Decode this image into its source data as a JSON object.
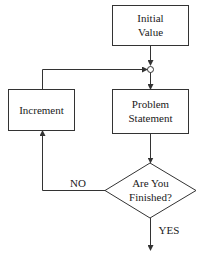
{
  "diagram": {
    "type": "flowchart",
    "nodes": [
      {
        "id": "initial",
        "shape": "rectangle",
        "line1": "Initial",
        "line2": "Value"
      },
      {
        "id": "problem",
        "shape": "rectangle",
        "line1": "Problem",
        "line2": "Statement"
      },
      {
        "id": "finished",
        "shape": "diamond",
        "line1": "Are You",
        "line2": "Finished?"
      },
      {
        "id": "increment",
        "shape": "rectangle",
        "label": "Increment"
      },
      {
        "id": "junction",
        "shape": "circle",
        "label": ""
      }
    ],
    "edges": [
      {
        "from": "initial",
        "to": "junction",
        "label": ""
      },
      {
        "from": "junction",
        "to": "problem",
        "label": ""
      },
      {
        "from": "problem",
        "to": "finished",
        "label": ""
      },
      {
        "from": "finished",
        "to": "increment",
        "label": "NO"
      },
      {
        "from": "increment",
        "to": "junction",
        "label": ""
      },
      {
        "from": "finished",
        "to": "exit",
        "label": "YES"
      }
    ],
    "labels": {
      "no": "NO",
      "yes": "YES"
    },
    "colors": {
      "line": "#333333",
      "background": "#ffffff"
    }
  }
}
